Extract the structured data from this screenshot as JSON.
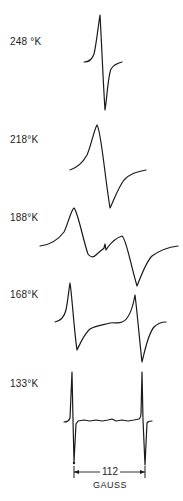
{
  "figure": {
    "spectra": [
      {
        "label": "248 °K",
        "label_pos": [
          10,
          36
        ]
      },
      {
        "label": "218°K",
        "label_pos": [
          10,
          134
        ]
      },
      {
        "label": "188°K",
        "label_pos": [
          10,
          212
        ]
      },
      {
        "label": "168°K",
        "label_pos": [
          10,
          289
        ]
      },
      {
        "label": "133°K",
        "label_pos": [
          10,
          378
        ]
      }
    ],
    "scale_bar": {
      "value": "112",
      "unit": "GAUSS"
    }
  },
  "colors": {
    "ink": "#1a1a1a",
    "background": "#ffffff"
  }
}
